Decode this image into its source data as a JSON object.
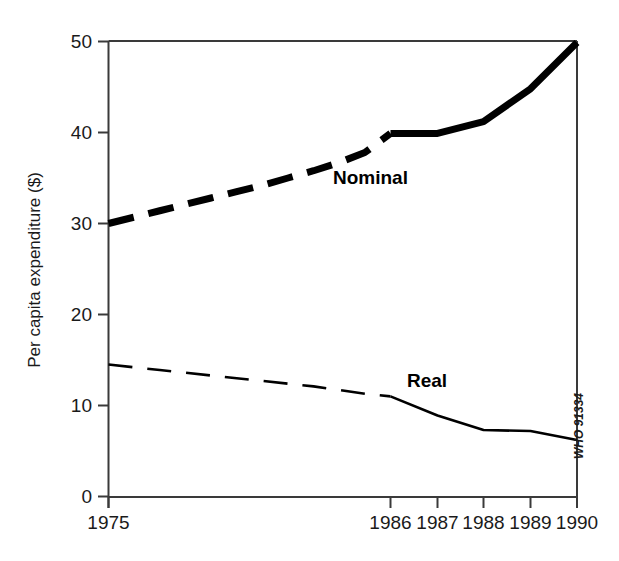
{
  "chart_data": {
    "type": "line",
    "title": "",
    "subtitle": "",
    "xlabel": "",
    "ylabel": "Per capita expenditure ($)",
    "xlim": [
      1975,
      1990
    ],
    "ylim": [
      0,
      50
    ],
    "yticks": [
      "0",
      "10",
      "20",
      "30",
      "40",
      "50"
    ],
    "ytick_values": [
      0,
      10,
      20,
      30,
      40,
      50
    ],
    "xticks": [
      "1975",
      "1986",
      "1987",
      "1988",
      "1989",
      "1990"
    ],
    "xtick_values": [
      1975,
      1986,
      1987,
      1988,
      1989,
      1990
    ],
    "grid": false,
    "legend_position": "inline-annotations",
    "annotations": [
      {
        "name": "nominal-label",
        "text": "Nominal",
        "x": 1985.3,
        "y": 34.5
      },
      {
        "name": "real-label",
        "text": "Real",
        "x": 1985.6,
        "y": 13.2
      },
      {
        "name": "credit",
        "text": "WHO 91334",
        "x": 1990,
        "y": 11.5
      }
    ],
    "series": [
      {
        "name": "Nominal",
        "style": "thick",
        "x": [
          1975,
          1976,
          1977,
          1978,
          1979,
          1980,
          1981,
          1982,
          1983,
          1984,
          1985,
          1986,
          1987,
          1988,
          1989,
          1990
        ],
        "values": [
          30.0,
          30.7,
          31.4,
          32.1,
          32.8,
          33.5,
          34.2,
          35.0,
          35.8,
          36.7,
          37.8,
          39.9,
          39.9,
          41.2,
          44.8,
          49.9
        ],
        "dashed_until": 1986,
        "solid_from": 1986
      },
      {
        "name": "Real",
        "style": "thin",
        "x": [
          1975,
          1976,
          1977,
          1978,
          1979,
          1980,
          1981,
          1982,
          1983,
          1984,
          1985,
          1986,
          1987,
          1988,
          1989,
          1990
        ],
        "values": [
          14.5,
          14.2,
          13.9,
          13.6,
          13.3,
          13.0,
          12.7,
          12.4,
          12.1,
          11.7,
          11.3,
          11.0,
          8.9,
          7.3,
          7.2,
          6.2
        ],
        "dashed_until": 1986,
        "solid_from": 1986
      }
    ],
    "colors": {
      "series": "#000000",
      "axis": "#3a3a3a",
      "text": "#1a1a1a",
      "background": "#ffffff"
    }
  }
}
